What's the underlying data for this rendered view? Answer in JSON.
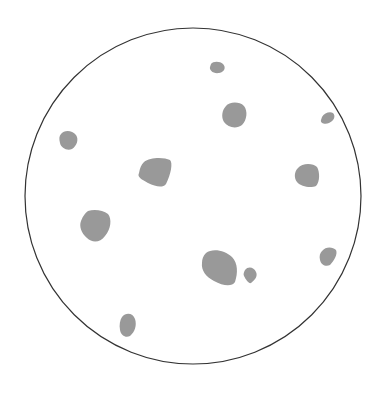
{
  "diagram": {
    "width": 382,
    "height": 396,
    "background": "#ffffff",
    "boundary": {
      "shape": "circle",
      "cx": 193,
      "cy": 196,
      "r": 168,
      "stroke": "#333333",
      "stroke_width": 1.2
    },
    "particle_color": "#999999",
    "particle_count": 11,
    "particles": [
      {
        "id": 1,
        "label": "small-top",
        "d": "M211,64 C213,61 220,61 223,64 C226,67 225,72 219,73 C213,74 209,70 210,67 Z"
      },
      {
        "id": 2,
        "label": "medium-top-right",
        "d": "M226,106 C229,102 239,101 244,106 C248,111 247,120 242,125 C237,129 228,128 224,122 C221,117 222,110 226,106 Z"
      },
      {
        "id": 3,
        "label": "small-far-right",
        "d": "M322,117 C324,113 330,111 333,113 C336,116 334,121 329,123 C325,125 320,123 321,120 Z"
      },
      {
        "id": 4,
        "label": "small-left",
        "d": "M61,134 C64,130 72,130 76,135 C79,139 77,146 72,149 C67,151 61,148 60,143 C59,139 59,136 61,134 Z"
      },
      {
        "id": 5,
        "label": "large-center-left",
        "d": "M144,162 C150,157 164,157 170,160 C173,163 171,174 166,184 C163,188 156,187 148,183 C141,179 137,177 139,173 C140,168 141,165 144,162 Z"
      },
      {
        "id": 6,
        "label": "medium-right",
        "d": "M298,168 C302,163 313,163 317,167 C320,172 320,182 316,186 C311,188 301,187 297,182 C294,178 294,172 298,168 Z"
      },
      {
        "id": 7,
        "label": "large-left",
        "d": "M88,211 C94,209 103,210 108,214 C112,219 111,229 105,236 C100,243 92,243 87,238 C81,233 79,226 81,221 C83,216 85,213 88,211 Z"
      },
      {
        "id": 8,
        "label": "large-bottom-center",
        "d": "M206,253 C212,248 225,250 232,257 C238,263 238,273 235,282 C232,287 223,286 214,281 C206,277 201,270 202,263 C202,259 203,256 206,253 Z"
      },
      {
        "id": 9,
        "label": "small-bottom-center",
        "d": "M245,270 C248,266 254,267 256,272 C258,276 255,280 251,283 C249,284 246,280 244,276 C243,274 244,272 245,270 Z"
      },
      {
        "id": 10,
        "label": "small-lower-right",
        "d": "M322,251 C326,246 333,247 336,250 C338,254 334,261 330,265 C326,267 321,265 320,260 C319,256 320,253 322,251 Z"
      },
      {
        "id": 11,
        "label": "small-bottom-left",
        "d": "M122,317 C126,312 133,313 135,319 C137,325 135,332 130,336 C126,338 121,336 120,330 C119,325 120,320 122,317 Z"
      }
    ]
  }
}
